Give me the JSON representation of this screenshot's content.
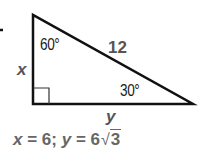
{
  "figure": {
    "marker": "-",
    "triangle": {
      "vertices": {
        "top": [
          33,
          15
        ],
        "right_angle": [
          33,
          104
        ],
        "right": [
          193,
          104
        ]
      },
      "right_angle_marker_size": 16,
      "stroke_color": "#111111"
    },
    "labels": {
      "angle_top": "60°",
      "hypotenuse": "12",
      "angle_right": "30°",
      "leg_vertical": "x",
      "leg_horizontal": "y"
    }
  },
  "answer": {
    "x_var": "x",
    "eq1": " = 6; ",
    "y_var": "y",
    "eq2": " = 6",
    "radical": "√",
    "radicand": "3"
  },
  "colors": {
    "line": "#111111",
    "label_dark": "#1a1a1a",
    "label_gray": "#555555",
    "answer_gray": "#666666"
  }
}
